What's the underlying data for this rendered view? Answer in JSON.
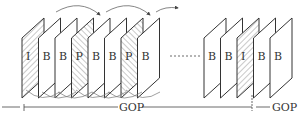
{
  "diagram": {
    "colors": {
      "stroke": "#333333",
      "hatch": "#666666",
      "background": "#ffffff",
      "arrow": "#666666"
    },
    "left_group": {
      "frames": [
        {
          "label": "I",
          "type": "I",
          "hatched": true
        },
        {
          "label": "B",
          "type": "B",
          "hatched": false
        },
        {
          "label": "B",
          "type": "B",
          "hatched": false
        },
        {
          "label": "P",
          "type": "P",
          "hatched": true
        },
        {
          "label": "B",
          "type": "B",
          "hatched": false
        },
        {
          "label": "B",
          "type": "B",
          "hatched": false
        },
        {
          "label": "P",
          "type": "P",
          "hatched": true
        },
        {
          "label": "B",
          "type": "B",
          "hatched": false
        }
      ]
    },
    "right_group": {
      "frames": [
        {
          "label": "B",
          "type": "B",
          "hatched": false
        },
        {
          "label": "B",
          "type": "B",
          "hatched": false
        },
        {
          "label": "I",
          "type": "I",
          "hatched": true
        },
        {
          "label": "B",
          "type": "B",
          "hatched": false
        },
        {
          "label": "B",
          "type": "B",
          "hatched": false
        }
      ]
    },
    "gop_labels": [
      "GOP",
      "GOP"
    ]
  }
}
